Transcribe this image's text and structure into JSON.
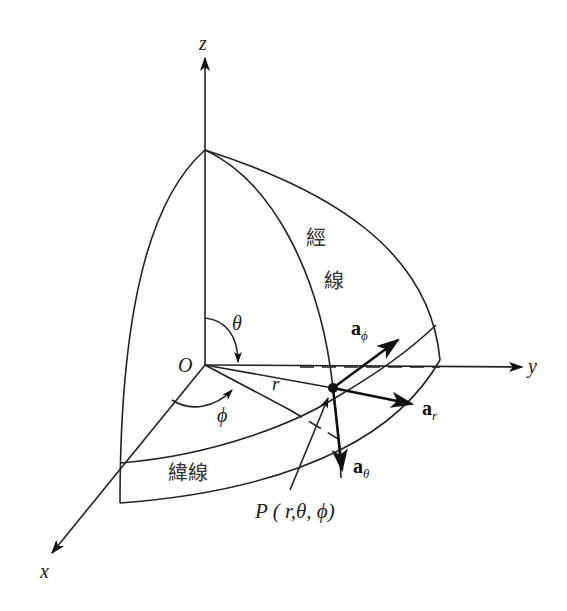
{
  "axes": {
    "z": "z",
    "y": "y",
    "x": "x",
    "origin": "O"
  },
  "angles": {
    "theta": "θ",
    "phi": "ϕ"
  },
  "radius_label": "r",
  "unit_vectors": {
    "a_phi": {
      "base": "a",
      "sub": "ϕ"
    },
    "a_r": {
      "base": "a",
      "sub": "r"
    },
    "a_theta": {
      "base": "a",
      "sub": "θ"
    }
  },
  "point_label": "P ( r,θ, ϕ)",
  "meridian_label": [
    "經",
    "線"
  ],
  "parallel_label": "緯線",
  "colors": {
    "line": "#222222",
    "background": "#ffffff"
  }
}
